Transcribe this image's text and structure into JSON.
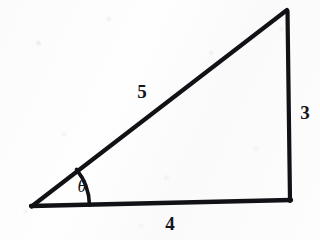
{
  "figure": {
    "kind": "right-triangle-diagram",
    "background_color": "#fdfdfd",
    "stroke_color": "#111216",
    "labels": {
      "hypotenuse": "5",
      "vertical_leg": "3",
      "base_leg": "4",
      "angle": "θ"
    },
    "geometry": {
      "vertex_left": [
        31,
        206
      ],
      "vertex_bottom_right": [
        291,
        199
      ],
      "vertex_top_right": [
        287,
        10
      ],
      "arc_radius": 58,
      "stroke_width": 4
    },
    "label_positions": {
      "hypotenuse": [
        142,
        91
      ],
      "vertical_leg": [
        305,
        112
      ],
      "base_leg": [
        170,
        223
      ],
      "angle": [
        82,
        186
      ]
    }
  }
}
